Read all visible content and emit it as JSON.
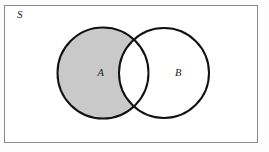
{
  "figure": {
    "type": "venn-diagram",
    "caption": "",
    "width": 269,
    "height": 152,
    "background_color": "#fdfdfd"
  },
  "universe": {
    "label": "S",
    "label_x": 17,
    "label_y": 18,
    "rect": {
      "x": 4.5,
      "y": 5.5,
      "width": 253,
      "height": 137
    },
    "border_color": "#8a8a8a",
    "border_width": 1,
    "fill_color": "#ffffff"
  },
  "sets": [
    {
      "name": "set-a",
      "label": "A",
      "label_x": 97.5,
      "label_y": 76,
      "cx": 103,
      "cy": 73,
      "r": 45.5,
      "stroke_color": "#111111",
      "stroke_width": 2,
      "fill_color": "#c9c9c9",
      "shaded": true
    },
    {
      "name": "set-b",
      "label": "B",
      "label_x": 175,
      "label_y": 76,
      "cx": 164,
      "cy": 73,
      "r": 45,
      "stroke_color": "#111111",
      "stroke_width": 2,
      "fill_color": "#ffffff",
      "shaded": false
    }
  ],
  "shading": {
    "region": "A-minus-B",
    "description": "A \\ B",
    "color": "#c9c9c9",
    "intersection_color": "#ffffff"
  }
}
